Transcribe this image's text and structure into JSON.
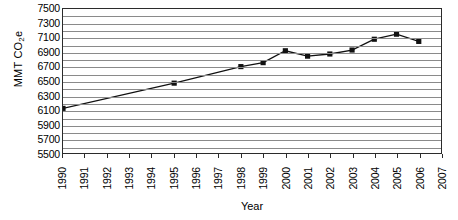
{
  "chart_data": {
    "type": "line",
    "title": "",
    "xlabel": "Year",
    "ylabel": "MMT CO2e",
    "ylabel_parts": {
      "prefix": "MMT CO",
      "sub": "2",
      "suffix": "e"
    },
    "x": [
      1990,
      1991,
      1992,
      1993,
      1994,
      1995,
      1996,
      1997,
      1998,
      1999,
      2000,
      2001,
      2002,
      2003,
      2004,
      2005,
      2006,
      2007
    ],
    "xtick_labels": [
      "1990",
      "1991",
      "1992",
      "1993",
      "1994",
      "1995",
      "1996",
      "1997",
      "1998",
      "1999",
      "2000",
      "2001",
      "2002",
      "2003",
      "2004",
      "2005",
      "2006",
      "2007"
    ],
    "xlim": [
      1990,
      2007
    ],
    "ylim": [
      5500,
      7500
    ],
    "ytick_labels": [
      "7500",
      "7300",
      "7100",
      "6900",
      "6700",
      "6500",
      "6300",
      "6100",
      "5900",
      "5700",
      "5500"
    ],
    "ytick_values": [
      7500,
      7300,
      7100,
      6900,
      6700,
      6500,
      6300,
      6100,
      5900,
      5700,
      5500
    ],
    "ystep": 200,
    "grid": "horizontal",
    "legend": "none",
    "series": [
      {
        "name": "MMT CO2e",
        "marker": "square",
        "marker_color": "#111111",
        "line_color": "#111111",
        "points": [
          {
            "x": 1990,
            "y": 6120,
            "marker": true
          },
          {
            "x": 1995,
            "y": 6470,
            "marker": true
          },
          {
            "x": 1998,
            "y": 6700,
            "marker": true
          },
          {
            "x": 1999,
            "y": 6755,
            "marker": true
          },
          {
            "x": 2000,
            "y": 6920,
            "marker": true
          },
          {
            "x": 2001,
            "y": 6845,
            "marker": true
          },
          {
            "x": 2002,
            "y": 6875,
            "marker": true
          },
          {
            "x": 2003,
            "y": 6930,
            "marker": true
          },
          {
            "x": 2004,
            "y": 7080,
            "marker": true
          },
          {
            "x": 2005,
            "y": 7150,
            "marker": true
          },
          {
            "x": 2006,
            "y": 7050,
            "marker": true
          }
        ]
      }
    ]
  }
}
